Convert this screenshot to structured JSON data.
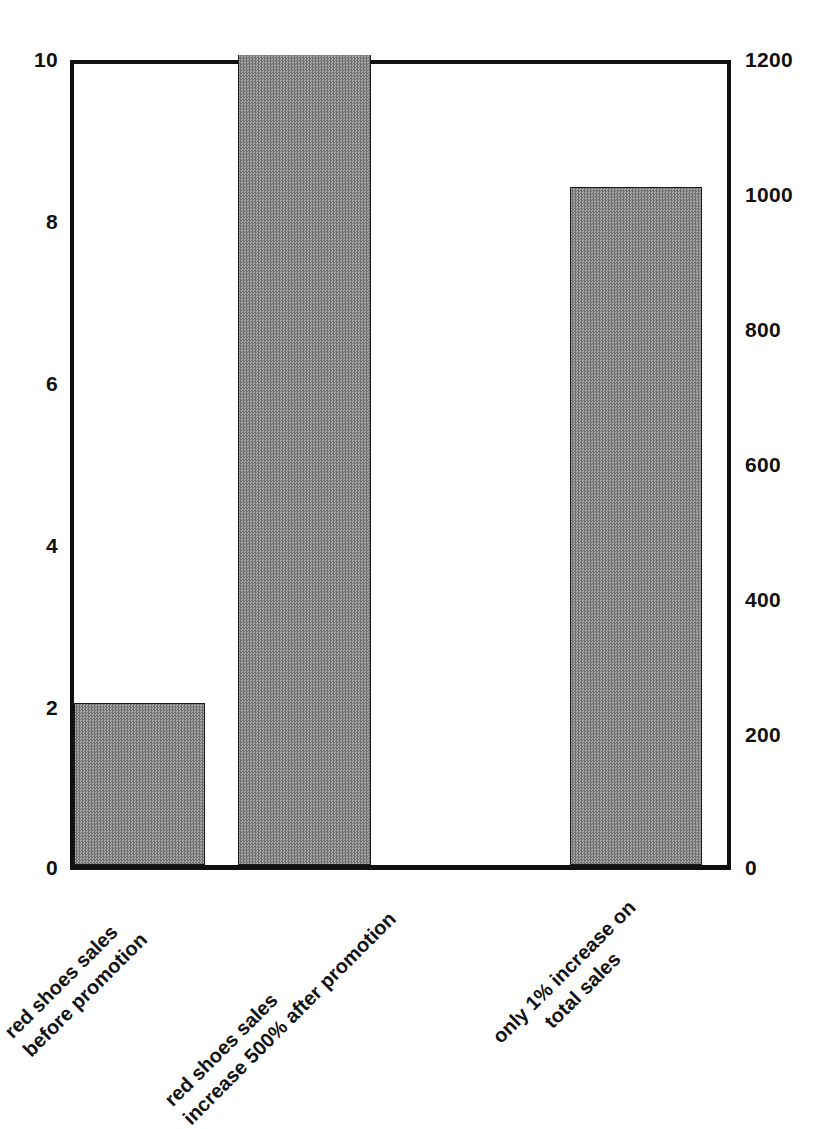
{
  "chart_data": {
    "type": "bar",
    "title": "",
    "subtitle": "",
    "xlabel": "",
    "ylabel": "",
    "categories": [
      "red shoes sales before promotion",
      "red shoes sales increase 500% after promotion",
      "only 1% increase on total sales"
    ],
    "category_lines": [
      [
        "red shoes sales",
        "before promotion"
      ],
      [
        "red shoes sales",
        "increase 500% after promotion"
      ],
      [
        "only 1% increase on",
        "total sales"
      ]
    ],
    "values": [
      2,
      10,
      8.35
    ],
    "values_right_axis": [
      240,
      1200,
      1000
    ],
    "left_axis": {
      "label": "",
      "ylim": [
        0,
        10
      ],
      "ticks": [
        0,
        2,
        4,
        6,
        8,
        10
      ],
      "tick_labels": [
        "0",
        "2",
        "4",
        "6",
        "8",
        "10"
      ]
    },
    "right_axis": {
      "label": "",
      "ylim": [
        0,
        1200
      ],
      "ticks": [
        0,
        200,
        400,
        600,
        800,
        1000,
        1200
      ],
      "tick_labels": [
        "0",
        "200",
        "400",
        "600",
        "800",
        "1000",
        "1200"
      ]
    },
    "grid": false,
    "legend": null,
    "bar_color": "#8c8c8c",
    "bar_edge_color": "#1a1a1a",
    "background_color": "#ffffff",
    "axis_color": "#111111"
  },
  "axes": {
    "left_ticks": [
      {
        "label": "10",
        "top_px": 60
      },
      {
        "label": "8",
        "top_px": 222
      },
      {
        "label": "6",
        "top_px": 384
      },
      {
        "label": "4",
        "top_px": 546
      },
      {
        "label": "2",
        "top_px": 708
      },
      {
        "label": "0",
        "top_px": 868
      }
    ],
    "right_ticks": [
      {
        "label": "1200",
        "top_px": 60
      },
      {
        "label": "1000",
        "top_px": 195
      },
      {
        "label": "800",
        "top_px": 330
      },
      {
        "label": "600",
        "top_px": 465
      },
      {
        "label": "400",
        "top_px": 600
      },
      {
        "label": "200",
        "top_px": 735
      },
      {
        "label": "0",
        "top_px": 868
      }
    ]
  },
  "bars": [
    {
      "name": "bar-red-shoes-before-promotion",
      "left_px": 0,
      "width_px": 131,
      "height_px": 162
    },
    {
      "name": "bar-red-shoes-after-promotion",
      "left_px": 164,
      "width_px": 133,
      "height_px": 810
    },
    {
      "name": "bar-only-1-percent-total-sales",
      "left_px": 496,
      "width_px": 132,
      "height_px": 678
    }
  ],
  "category_labels": [
    {
      "left_px": 36,
      "top_px": 1010
    },
    {
      "left_px": 196,
      "top_px": 1078
    },
    {
      "left_px": 524,
      "top_px": 1015
    }
  ]
}
